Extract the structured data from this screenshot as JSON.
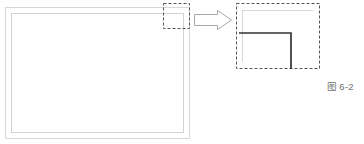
{
  "figure": {
    "caption_label": "图",
    "caption_number": "6-2",
    "caption_full": "图 6-2",
    "background_color": "#ffffff"
  },
  "colors": {
    "faint_line": "#d8d8d8",
    "light_line": "#cfcfcf",
    "dashed_line": "#555555",
    "bold_line": "#333333",
    "arrow_outline": "#a8a8a8",
    "caption_text": "#6f6f6f"
  },
  "overview_panel": {
    "name_label": "overview-rectangle",
    "outer_rect": {
      "x": 5,
      "y": 7,
      "width": 185,
      "height": 132
    },
    "inner_rect": {
      "x": 11,
      "y": 13,
      "width": 173,
      "height": 120
    },
    "stroke_color": "#d8d8d8",
    "stroke_width": 1
  },
  "source_highlight": {
    "name_label": "source-detail-box",
    "rect": {
      "x": 163,
      "y": 3,
      "width": 27,
      "height": 26
    },
    "stroke_color": "#555555",
    "dash_pattern": "3 2"
  },
  "callout_arrow": {
    "name_label": "callout-arrow",
    "direction": "right",
    "bounds": {
      "x": 194,
      "y": 10,
      "width": 38,
      "height": 20
    },
    "stroke_color": "#a8a8a8",
    "fill_color": "#ffffff"
  },
  "detail_panel": {
    "name_label": "detail-enlargement-box",
    "rect": {
      "x": 236,
      "y": 3,
      "width": 84,
      "height": 66
    },
    "stroke_color": "#555555",
    "dash_pattern": "3 2",
    "faint_corner": {
      "name_label": "faint-corner-lines",
      "horizontal": {
        "x1": 242,
        "y1": 10,
        "x2": 313,
        "y2": 10
      },
      "vertical": {
        "x1": 242,
        "y1": 10,
        "x2": 242,
        "y2": 62
      },
      "stroke_color": "#d8d8d8"
    },
    "bold_corner": {
      "name_label": "bold-corner-lines",
      "horizontal": {
        "x1": 240,
        "y1": 33,
        "x2": 291,
        "y2": 33
      },
      "vertical": {
        "x1": 291,
        "y1": 33,
        "x2": 291,
        "y2": 69
      },
      "stroke_color": "#333333",
      "stroke_width": 1.6
    }
  }
}
